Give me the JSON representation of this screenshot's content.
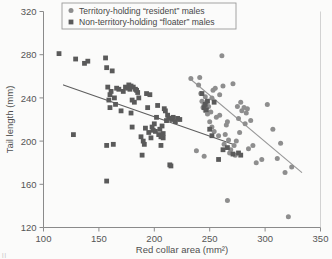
{
  "figure": {
    "background_color": "#fbfbfa",
    "frame_color": "#8a8a8a",
    "marker_resident_color": "#8e8e8e",
    "marker_floater_color": "#5a5a5a",
    "line_resident_color": "#9a9a9a",
    "line_floater_color": "#5e5e5e",
    "bottom_artifact": "ll"
  },
  "legend": {
    "position": "top-center",
    "items": [
      {
        "marker": "circle-marker",
        "marker_shape": "circle",
        "label": "Territory-holding “resident” males",
        "color": "#8e8e8e"
      },
      {
        "marker": "square-marker",
        "marker_shape": "square",
        "label": "Non-territory-holding “floater” males",
        "color": "#5a5a5a"
      }
    ]
  },
  "chart_data": {
    "type": "scatter",
    "title": "",
    "xlabel": "Red collar area (mm²)",
    "ylabel": "Tail length (mm)",
    "xlim": [
      100,
      350
    ],
    "ylim": [
      120,
      320
    ],
    "xticks": [
      100,
      150,
      200,
      250,
      300,
      350
    ],
    "yticks": [
      120,
      160,
      200,
      240,
      280,
      320
    ],
    "xticklabels": [
      "100",
      "150",
      "200",
      "250",
      "300",
      "350"
    ],
    "yticklabels": [
      "120",
      "160",
      "200",
      "240",
      "280",
      "320"
    ],
    "grid": false,
    "legend_position": "top-center",
    "series": [
      {
        "name": "Territory-holding “resident” males",
        "marker": "circle",
        "color": "#8e8e8e",
        "points": [
          [
            233,
            258
          ],
          [
            240,
            252
          ],
          [
            241,
            259
          ],
          [
            242,
            244
          ],
          [
            243,
            237
          ],
          [
            244,
            231
          ],
          [
            245,
            234
          ],
          [
            246,
            241
          ],
          [
            246,
            228
          ],
          [
            247,
            236
          ],
          [
            248,
            225
          ],
          [
            249,
            232
          ],
          [
            250,
            218
          ],
          [
            251,
            227
          ],
          [
            252,
            213
          ],
          [
            253,
            247
          ],
          [
            254,
            209
          ],
          [
            255,
            249
          ],
          [
            256,
            222
          ],
          [
            258,
            205
          ],
          [
            259,
            243
          ],
          [
            261,
            279
          ],
          [
            262,
            251
          ],
          [
            263,
            197
          ],
          [
            264,
            206
          ],
          [
            265,
            215
          ],
          [
            266,
            145
          ],
          [
            267,
            201
          ],
          [
            268,
            189
          ],
          [
            269,
            192
          ],
          [
            271,
            253
          ],
          [
            272,
            196
          ],
          [
            273,
            187
          ],
          [
            274,
            200
          ],
          [
            275,
            232
          ],
          [
            276,
            221
          ],
          [
            277,
            208
          ],
          [
            278,
            236
          ],
          [
            279,
            228
          ],
          [
            281,
            231
          ],
          [
            282,
            216
          ],
          [
            283,
            226
          ],
          [
            284,
            230
          ],
          [
            285,
            193
          ],
          [
            287,
            219
          ],
          [
            289,
            196
          ],
          [
            292,
            180
          ],
          [
            297,
            183
          ],
          [
            302,
            234
          ],
          [
            307,
            211
          ],
          [
            311,
            184
          ],
          [
            314,
            198
          ],
          [
            318,
            171
          ],
          [
            321,
            130
          ],
          [
            324,
            176
          ],
          [
            238,
            191
          ],
          [
            245,
            186
          ],
          [
            252,
            240
          ],
          [
            259,
            224
          ],
          [
            266,
            218
          ]
        ]
      },
      {
        "name": "Non-territory-holding “floater” males",
        "marker": "square",
        "color": "#5a5a5a",
        "points": [
          [
            114,
            281
          ],
          [
            127,
            206
          ],
          [
            129,
            276
          ],
          [
            137,
            272
          ],
          [
            140,
            274
          ],
          [
            156,
            277
          ],
          [
            157,
            268
          ],
          [
            157,
            196
          ],
          [
            157,
            163
          ],
          [
            158,
            250
          ],
          [
            159,
            238
          ],
          [
            160,
            243
          ],
          [
            160,
            231
          ],
          [
            161,
            246
          ],
          [
            162,
            265
          ],
          [
            163,
            197
          ],
          [
            164,
            240
          ],
          [
            165,
            234
          ],
          [
            166,
            249
          ],
          [
            168,
            248
          ],
          [
            170,
            228
          ],
          [
            172,
            246
          ],
          [
            174,
            250
          ],
          [
            176,
            249
          ],
          [
            177,
            252
          ],
          [
            178,
            248
          ],
          [
            179,
            251
          ],
          [
            179,
            226
          ],
          [
            180,
            213
          ],
          [
            181,
            250
          ],
          [
            182,
            236
          ],
          [
            183,
            248
          ],
          [
            184,
            247
          ],
          [
            186,
            240
          ],
          [
            188,
            204
          ],
          [
            189,
            187
          ],
          [
            190,
            200
          ],
          [
            191,
            197
          ],
          [
            192,
            212
          ],
          [
            193,
            244
          ],
          [
            194,
            231
          ],
          [
            195,
            208
          ],
          [
            196,
            243
          ],
          [
            197,
            203
          ],
          [
            198,
            213
          ],
          [
            199,
            210
          ],
          [
            200,
            216
          ],
          [
            201,
            209
          ],
          [
            202,
            222
          ],
          [
            203,
            233
          ],
          [
            204,
            206
          ],
          [
            205,
            211
          ],
          [
            206,
            196
          ],
          [
            207,
            214
          ],
          [
            208,
            203
          ],
          [
            209,
            230
          ],
          [
            210,
            228
          ],
          [
            211,
            219
          ],
          [
            212,
            224
          ],
          [
            213,
            221
          ],
          [
            214,
            178
          ],
          [
            215,
            177
          ],
          [
            216,
            220
          ],
          [
            217,
            222
          ],
          [
            219,
            218
          ],
          [
            221,
            221
          ],
          [
            223,
            220
          ],
          [
            243,
            244
          ],
          [
            245,
            231
          ],
          [
            246,
            234
          ],
          [
            247,
            229
          ],
          [
            248,
            237
          ],
          [
            250,
            211
          ],
          [
            252,
            205
          ],
          [
            254,
            236
          ],
          [
            258,
            183
          ],
          [
            262,
            192
          ],
          [
            266,
            194
          ],
          [
            271,
            188
          ],
          [
            276,
            189
          ],
          [
            278,
            187
          ],
          [
            180,
            238
          ],
          [
            185,
            245
          ],
          [
            206,
            204
          ],
          [
            208,
            207
          ]
        ]
      }
    ],
    "trendlines": [
      {
        "name": "resident-trendline",
        "series": "Territory-holding “resident” males",
        "color": "#9a9a9a",
        "x0": 232,
        "y0": 258,
        "x1": 333,
        "y1": 171
      },
      {
        "name": "floater-trendline",
        "series": "Non-territory-holding “floater” males",
        "color": "#5e5e5e",
        "x0": 118,
        "y0": 252,
        "x1": 271,
        "y1": 197
      }
    ]
  }
}
